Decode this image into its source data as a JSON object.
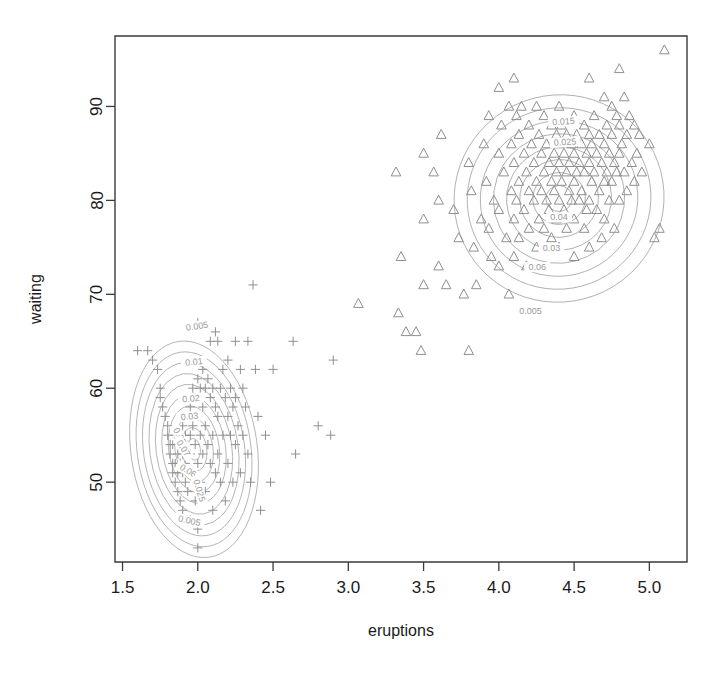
{
  "chart_data": {
    "type": "scatter",
    "title": "",
    "xlabel": "eruptions",
    "ylabel": "waiting",
    "xlim": [
      1.45,
      5.25
    ],
    "ylim": [
      41.5,
      97.5
    ],
    "xticks": [
      "1.5",
      "2.0",
      "2.5",
      "3.0",
      "3.5",
      "4.0",
      "4.5",
      "5.0"
    ],
    "xtick_values": [
      1.5,
      2.0,
      2.5,
      3.0,
      3.5,
      4.0,
      4.5,
      5.0
    ],
    "yticks": [
      "50",
      "60",
      "70",
      "80",
      "90"
    ],
    "ytick_values": [
      50,
      60,
      70,
      80,
      90
    ],
    "grid": false,
    "legend": "none",
    "marker_colors": {
      "group_short": "#8f8f8f",
      "group_long": "#8f8f8f",
      "contour": "#adadad",
      "axis": "#333333"
    },
    "series": [
      {
        "name": "short eruptions",
        "marker": "plus",
        "points": [
          [
            1.6,
            64
          ],
          [
            1.667,
            64
          ],
          [
            1.7,
            63
          ],
          [
            1.733,
            62
          ],
          [
            1.75,
            60
          ],
          [
            1.75,
            59
          ],
          [
            1.767,
            58
          ],
          [
            1.783,
            57
          ],
          [
            1.8,
            56
          ],
          [
            1.8,
            55
          ],
          [
            1.817,
            54
          ],
          [
            1.817,
            53
          ],
          [
            1.833,
            54
          ],
          [
            1.833,
            52
          ],
          [
            1.833,
            51
          ],
          [
            1.85,
            55
          ],
          [
            1.85,
            52
          ],
          [
            1.85,
            50
          ],
          [
            1.867,
            53
          ],
          [
            1.867,
            51
          ],
          [
            1.867,
            49
          ],
          [
            1.883,
            54
          ],
          [
            1.883,
            52
          ],
          [
            1.883,
            48
          ],
          [
            1.9,
            56
          ],
          [
            1.9,
            53
          ],
          [
            1.9,
            51
          ],
          [
            1.9,
            47
          ],
          [
            1.917,
            55
          ],
          [
            1.917,
            52
          ],
          [
            1.917,
            50
          ],
          [
            1.933,
            57
          ],
          [
            1.933,
            54
          ],
          [
            1.933,
            49
          ],
          [
            1.95,
            58
          ],
          [
            1.95,
            55
          ],
          [
            1.95,
            53
          ],
          [
            1.95,
            46
          ],
          [
            1.967,
            60
          ],
          [
            1.967,
            56
          ],
          [
            1.967,
            51
          ],
          [
            1.983,
            59
          ],
          [
            1.983,
            54
          ],
          [
            1.983,
            48
          ],
          [
            2.0,
            67
          ],
          [
            2.0,
            61
          ],
          [
            2.0,
            57
          ],
          [
            2.0,
            52
          ],
          [
            2.0,
            45
          ],
          [
            2.0,
            43
          ],
          [
            2.017,
            60
          ],
          [
            2.017,
            55
          ],
          [
            2.017,
            50
          ],
          [
            2.033,
            62
          ],
          [
            2.033,
            58
          ],
          [
            2.033,
            53
          ],
          [
            2.05,
            60
          ],
          [
            2.05,
            56
          ],
          [
            2.05,
            49
          ],
          [
            2.067,
            61
          ],
          [
            2.067,
            54
          ],
          [
            2.083,
            65
          ],
          [
            2.083,
            59
          ],
          [
            2.083,
            52
          ],
          [
            2.1,
            60
          ],
          [
            2.1,
            55
          ],
          [
            2.1,
            47
          ],
          [
            2.117,
            66
          ],
          [
            2.117,
            58
          ],
          [
            2.117,
            51
          ],
          [
            2.133,
            65
          ],
          [
            2.133,
            57
          ],
          [
            2.133,
            53
          ],
          [
            2.15,
            60
          ],
          [
            2.15,
            50
          ],
          [
            2.167,
            62
          ],
          [
            2.167,
            55
          ],
          [
            2.183,
            59
          ],
          [
            2.183,
            48
          ],
          [
            2.2,
            63
          ],
          [
            2.2,
            57
          ],
          [
            2.2,
            52
          ],
          [
            2.217,
            60
          ],
          [
            2.217,
            55
          ],
          [
            2.233,
            58
          ],
          [
            2.233,
            50
          ],
          [
            2.25,
            65
          ],
          [
            2.25,
            59
          ],
          [
            2.25,
            54
          ],
          [
            2.267,
            56
          ],
          [
            2.283,
            62
          ],
          [
            2.283,
            51
          ],
          [
            2.3,
            60
          ],
          [
            2.3,
            55
          ],
          [
            2.317,
            58
          ],
          [
            2.333,
            65
          ],
          [
            2.333,
            53
          ],
          [
            2.35,
            50
          ],
          [
            2.367,
            71
          ],
          [
            2.383,
            62
          ],
          [
            2.4,
            57
          ],
          [
            2.417,
            47
          ],
          [
            2.45,
            55
          ],
          [
            2.483,
            50
          ],
          [
            2.5,
            62
          ],
          [
            2.633,
            65
          ],
          [
            2.65,
            53
          ],
          [
            2.8,
            56
          ],
          [
            2.883,
            55
          ],
          [
            2.9,
            63
          ]
        ]
      },
      {
        "name": "long eruptions",
        "marker": "triangle",
        "points": [
          [
            3.067,
            69
          ],
          [
            3.317,
            83
          ],
          [
            3.333,
            68
          ],
          [
            3.35,
            74
          ],
          [
            3.383,
            66
          ],
          [
            3.45,
            66
          ],
          [
            3.483,
            64
          ],
          [
            3.5,
            85
          ],
          [
            3.5,
            78
          ],
          [
            3.5,
            71
          ],
          [
            3.567,
            83
          ],
          [
            3.6,
            80
          ],
          [
            3.6,
            73
          ],
          [
            3.617,
            87
          ],
          [
            3.65,
            71
          ],
          [
            3.7,
            79
          ],
          [
            3.733,
            76
          ],
          [
            3.767,
            70
          ],
          [
            3.8,
            84
          ],
          [
            3.8,
            64
          ],
          [
            3.817,
            81
          ],
          [
            3.833,
            75
          ],
          [
            3.85,
            71
          ],
          [
            3.883,
            78
          ],
          [
            3.9,
            86
          ],
          [
            3.917,
            82
          ],
          [
            3.933,
            89
          ],
          [
            3.933,
            77
          ],
          [
            3.95,
            74
          ],
          [
            3.967,
            80
          ],
          [
            4.0,
            92
          ],
          [
            4.0,
            85
          ],
          [
            4.0,
            79
          ],
          [
            4.0,
            73
          ],
          [
            4.017,
            88
          ],
          [
            4.033,
            83
          ],
          [
            4.05,
            76
          ],
          [
            4.067,
            90
          ],
          [
            4.067,
            70
          ],
          [
            4.083,
            86
          ],
          [
            4.083,
            81
          ],
          [
            4.1,
            93
          ],
          [
            4.1,
            84
          ],
          [
            4.1,
            78
          ],
          [
            4.1,
            74
          ],
          [
            4.117,
            89
          ],
          [
            4.117,
            80
          ],
          [
            4.133,
            87
          ],
          [
            4.133,
            82
          ],
          [
            4.133,
            76
          ],
          [
            4.15,
            90
          ],
          [
            4.167,
            85
          ],
          [
            4.167,
            79
          ],
          [
            4.183,
            83
          ],
          [
            4.183,
            73
          ],
          [
            4.2,
            88
          ],
          [
            4.2,
            81
          ],
          [
            4.2,
            77
          ],
          [
            4.217,
            86
          ],
          [
            4.233,
            84
          ],
          [
            4.233,
            80
          ],
          [
            4.25,
            90
          ],
          [
            4.25,
            82
          ],
          [
            4.25,
            75
          ],
          [
            4.267,
            87
          ],
          [
            4.267,
            78
          ],
          [
            4.283,
            85
          ],
          [
            4.283,
            81
          ],
          [
            4.3,
            89
          ],
          [
            4.3,
            83
          ],
          [
            4.3,
            77
          ],
          [
            4.317,
            86
          ],
          [
            4.317,
            80
          ],
          [
            4.333,
            84
          ],
          [
            4.333,
            79
          ],
          [
            4.35,
            88
          ],
          [
            4.35,
            82
          ],
          [
            4.35,
            76
          ],
          [
            4.367,
            85
          ],
          [
            4.367,
            81
          ],
          [
            4.383,
            87
          ],
          [
            4.383,
            83
          ],
          [
            4.383,
            78
          ],
          [
            4.4,
            90
          ],
          [
            4.4,
            86
          ],
          [
            4.4,
            84
          ],
          [
            4.4,
            80
          ],
          [
            4.4,
            75
          ],
          [
            4.417,
            88
          ],
          [
            4.417,
            82
          ],
          [
            4.433,
            85
          ],
          [
            4.433,
            79
          ],
          [
            4.45,
            87
          ],
          [
            4.45,
            83
          ],
          [
            4.45,
            77
          ],
          [
            4.467,
            84
          ],
          [
            4.467,
            81
          ],
          [
            4.483,
            86
          ],
          [
            4.483,
            80
          ],
          [
            4.5,
            89
          ],
          [
            4.5,
            85
          ],
          [
            4.5,
            82
          ],
          [
            4.5,
            78
          ],
          [
            4.5,
            74
          ],
          [
            4.517,
            87
          ],
          [
            4.517,
            83
          ],
          [
            4.533,
            84
          ],
          [
            4.533,
            80
          ],
          [
            4.55,
            86
          ],
          [
            4.55,
            81
          ],
          [
            4.567,
            88
          ],
          [
            4.567,
            83
          ],
          [
            4.567,
            77
          ],
          [
            4.583,
            85
          ],
          [
            4.583,
            79
          ],
          [
            4.6,
            93
          ],
          [
            4.6,
            87
          ],
          [
            4.6,
            84
          ],
          [
            4.6,
            80
          ],
          [
            4.6,
            75
          ],
          [
            4.617,
            86
          ],
          [
            4.617,
            82
          ],
          [
            4.633,
            89
          ],
          [
            4.633,
            83
          ],
          [
            4.65,
            85
          ],
          [
            4.65,
            79
          ],
          [
            4.667,
            87
          ],
          [
            4.667,
            81
          ],
          [
            4.683,
            84
          ],
          [
            4.683,
            76
          ],
          [
            4.7,
            91
          ],
          [
            4.7,
            86
          ],
          [
            4.7,
            82
          ],
          [
            4.7,
            78
          ],
          [
            4.717,
            88
          ],
          [
            4.717,
            83
          ],
          [
            4.733,
            85
          ],
          [
            4.733,
            80
          ],
          [
            4.75,
            90
          ],
          [
            4.75,
            87
          ],
          [
            4.75,
            82
          ],
          [
            4.767,
            84
          ],
          [
            4.767,
            77
          ],
          [
            4.783,
            89
          ],
          [
            4.783,
            83
          ],
          [
            4.8,
            94
          ],
          [
            4.8,
            88
          ],
          [
            4.8,
            85
          ],
          [
            4.8,
            80
          ],
          [
            4.817,
            86
          ],
          [
            4.833,
            91
          ],
          [
            4.833,
            83
          ],
          [
            4.85,
            87
          ],
          [
            4.85,
            81
          ],
          [
            4.867,
            89
          ],
          [
            4.883,
            84
          ],
          [
            4.9,
            88
          ],
          [
            4.9,
            82
          ],
          [
            4.917,
            85
          ],
          [
            4.933,
            87
          ],
          [
            4.95,
            83
          ],
          [
            5.0,
            86
          ],
          [
            5.033,
            76
          ],
          [
            5.067,
            77
          ],
          [
            5.1,
            96
          ]
        ]
      }
    ],
    "contours": {
      "description": "bivariate kernel density estimate contours",
      "levels": [
        0.005,
        0.01,
        0.015,
        0.02,
        0.025,
        0.03,
        0.04,
        0.05,
        0.06,
        0.07
      ],
      "clusters": [
        {
          "name": "short-eruption mode",
          "center": [
            1.975,
            53.5
          ],
          "labeled_levels": [
            "0.005",
            "0.01",
            "0.02",
            "0.03",
            "0.04",
            "0.05",
            "0.06",
            "0.07",
            "0.025"
          ]
        },
        {
          "name": "long-eruption mode",
          "center": [
            4.4,
            80.2
          ],
          "labeled_levels": [
            "0.005",
            "0.015",
            "0.025",
            "0.02",
            "0.06",
            "0.04"
          ]
        }
      ]
    },
    "contour_labels": [
      {
        "text": "0.005",
        "x": 1.995,
        "y": 66.6,
        "rotate": -8
      },
      {
        "text": "0.01",
        "x": 1.975,
        "y": 62.8,
        "rotate": -6
      },
      {
        "text": "0.02",
        "x": 1.955,
        "y": 58.9,
        "rotate": -5
      },
      {
        "text": "0.03",
        "x": 1.945,
        "y": 57.0,
        "rotate": -5
      },
      {
        "text": "0.05",
        "x": 1.88,
        "y": 54.9,
        "rotate": 62
      },
      {
        "text": "0.07",
        "x": 1.905,
        "y": 53.6,
        "rotate": 58
      },
      {
        "text": "0.06",
        "x": 1.935,
        "y": 51.2,
        "rotate": 30
      },
      {
        "text": "0.025",
        "x": 2.01,
        "y": 49.1,
        "rotate": 74
      },
      {
        "text": "0.005",
        "x": 1.945,
        "y": 45.9,
        "rotate": 12
      },
      {
        "text": "0.015",
        "x": 4.43,
        "y": 88.4,
        "rotate": -4
      },
      {
        "text": "0.025",
        "x": 4.44,
        "y": 86.2,
        "rotate": -4
      },
      {
        "text": "0.04",
        "x": 4.4,
        "y": 78.2,
        "rotate": 0
      },
      {
        "text": "0.03",
        "x": 4.35,
        "y": 74.9,
        "rotate": 0
      },
      {
        "text": "0.06",
        "x": 4.255,
        "y": 72.9,
        "rotate": 0
      },
      {
        "text": "0.005",
        "x": 4.21,
        "y": 68.2,
        "rotate": 0
      }
    ]
  }
}
